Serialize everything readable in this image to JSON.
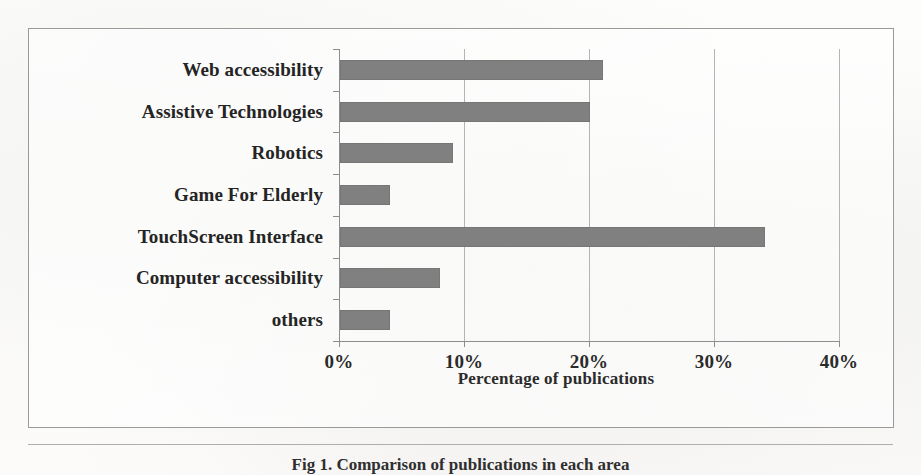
{
  "figure": {
    "caption": "Fig 1. Comparison of publications in each area",
    "axis_title": "Percentage of publications"
  },
  "chart_data": {
    "type": "bar",
    "orientation": "horizontal",
    "title": "",
    "xlabel": "Percentage of publications",
    "ylabel": "",
    "xlim": [
      0,
      40
    ],
    "grid": true,
    "legend": null,
    "bar_color": "#808080",
    "xtick_labels": [
      "0%",
      "10%",
      "20%",
      "30%",
      "40%"
    ],
    "xtick_values": [
      0,
      10,
      20,
      30,
      40
    ],
    "categories": [
      "Web accessibility",
      "Assistive Technologies",
      "Robotics",
      "Game For Elderly",
      "TouchScreen Interface",
      "Computer  accessibility",
      "others"
    ],
    "values": [
      21,
      20,
      9,
      4,
      34,
      8,
      4
    ],
    "value_labels": [
      "21%",
      "20%",
      "9%",
      "4%",
      "34%",
      "8%",
      "4%"
    ]
  }
}
